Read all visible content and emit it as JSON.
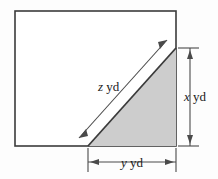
{
  "figure": {
    "labels": {
      "hypotenuse": {
        "variable": "z",
        "unit": "yd"
      },
      "vertical": {
        "variable": "x",
        "unit": "yd"
      },
      "horizontal": {
        "variable": "y",
        "unit": "yd"
      }
    },
    "colors": {
      "outline": "#3b3b3b",
      "shade_fill": "#cdcdcd",
      "shade_stroke": "#4a4a4a",
      "dimension_line": "#4a4a4a",
      "background": "#fdfdfd",
      "text": "#1a1a1a"
    },
    "geometry": {
      "rect": {
        "x": 15,
        "y": 11,
        "width": 161,
        "height": 135
      },
      "triangle": {
        "bottom_left_x": 88,
        "bottom_y": 146,
        "right_x": 176,
        "top_y": 48
      },
      "vertical_dim_x": 190,
      "vertical_dim_top": 48,
      "vertical_dim_bottom": 146,
      "horizontal_dim_y": 162,
      "horizontal_dim_left": 88,
      "horizontal_dim_right": 176
    }
  }
}
